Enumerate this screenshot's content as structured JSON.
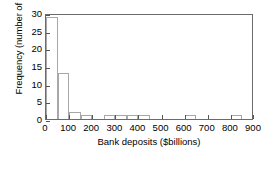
{
  "chart_data": {
    "type": "bar",
    "title": "",
    "xlabel": "Bank deposits ($billions)",
    "ylabel": "Frequency (number of banks)",
    "xlim": [
      0,
      900
    ],
    "ylim": [
      0,
      30
    ],
    "xticks": [
      0,
      100,
      200,
      300,
      400,
      500,
      600,
      700,
      800,
      900
    ],
    "yticks": [
      0,
      5,
      10,
      15,
      20,
      25,
      30
    ],
    "xtick_labels": [
      "0",
      "100",
      "200",
      "300",
      "400",
      "500",
      "600",
      "700",
      "800",
      "900"
    ],
    "ytick_labels": [
      "0",
      "5",
      "10",
      "15",
      "20",
      "25",
      "30"
    ],
    "grid": false,
    "legend": "none",
    "bin_width": 50,
    "bin_edges": [
      0,
      50,
      100,
      150,
      200,
      250,
      300,
      350,
      400,
      450,
      500,
      550,
      600,
      650,
      700,
      750,
      800,
      850,
      900
    ],
    "categories": [
      "0-50",
      "50-100",
      "100-150",
      "150-200",
      "200-250",
      "250-300",
      "300-350",
      "350-400",
      "400-450",
      "450-500",
      "500-550",
      "550-600",
      "600-650",
      "650-700",
      "700-750",
      "750-800",
      "800-850",
      "850-900"
    ],
    "values": [
      29,
      13,
      2,
      1,
      0,
      1,
      1,
      1,
      1,
      0,
      0,
      0,
      1,
      0,
      0,
      0,
      1,
      0
    ],
    "bar_fill_color": "#ffffff",
    "bar_edge_color": "#a8a8a8",
    "frame_color": "#6b6b6b"
  }
}
